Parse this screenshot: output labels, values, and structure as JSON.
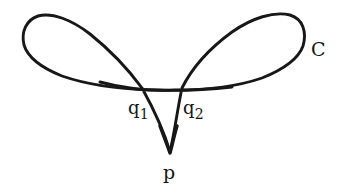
{
  "figure": {
    "kind": "hand-drawn-mathematical-curve-diagram",
    "background_color": "#ffffff",
    "stroke_color": "#171717",
    "width": 347,
    "height": 196
  },
  "labels": {
    "curve": "C",
    "crossing_left": "q",
    "crossing_left_subscript": "1",
    "crossing_right": "q",
    "crossing_right_subscript": "2",
    "cusp": "p"
  },
  "geometry": {
    "cusp_point": {
      "x": 170,
      "y": 153
    },
    "crossing_left_point": {
      "x": 142,
      "y": 88
    },
    "crossing_right_point": {
      "x": 182,
      "y": 88
    },
    "left_lobe_extent_x": 22,
    "right_lobe_extent_x": 305,
    "lobe_top_y": 14,
    "stroke_width": 2.6
  }
}
